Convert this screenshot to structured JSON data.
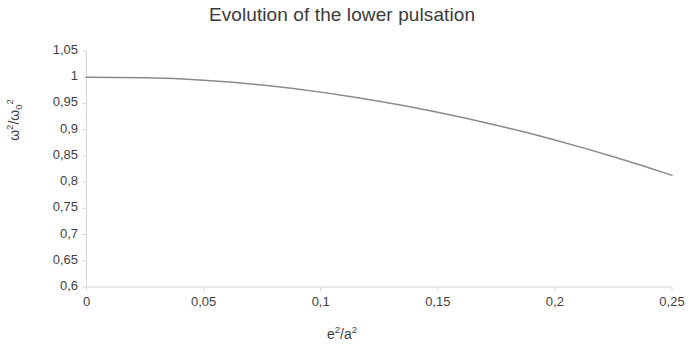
{
  "chart_data": {
    "type": "line",
    "title": "Evolution of the lower pulsation",
    "xlabel": "e²/a²",
    "ylabel": "ω²/ω₀²",
    "xlim": [
      0,
      0.25
    ],
    "ylim": [
      0.6,
      1.05
    ],
    "xtick_labels": [
      "0",
      "0,05",
      "0,1",
      "0,15",
      "0,2",
      "0,25"
    ],
    "xtick_values": [
      0,
      0.05,
      0.1,
      0.15,
      0.2,
      0.25
    ],
    "ytick_labels": [
      "0,6",
      "0,65",
      "0,7",
      "0,75",
      "0,8",
      "0,85",
      "0,9",
      "0,95",
      "1",
      "1,05"
    ],
    "ytick_values": [
      0.6,
      0.65,
      0.7,
      0.75,
      0.8,
      0.85,
      0.9,
      0.95,
      1.0,
      1.05
    ],
    "grid": false,
    "legend": false,
    "line_color": "#8a8a8a",
    "axis_color": "#d4d4d4",
    "series": [
      {
        "name": "lower pulsation",
        "x": [
          0.0,
          0.0125,
          0.025,
          0.0375,
          0.05,
          0.0625,
          0.075,
          0.0875,
          0.1,
          0.1125,
          0.125,
          0.1375,
          0.15,
          0.1625,
          0.175,
          0.1875,
          0.2,
          0.2125,
          0.225,
          0.2375,
          0.25
        ],
        "values": [
          1.0,
          0.9996,
          0.9988,
          0.9974,
          0.9943,
          0.9902,
          0.9853,
          0.9789,
          0.9716,
          0.9634,
          0.9542,
          0.9442,
          0.9332,
          0.9214,
          0.9086,
          0.8949,
          0.8803,
          0.8648,
          0.8484,
          0.8311,
          0.8129
        ]
      }
    ]
  },
  "title_text": "Evolution of the lower pulsation",
  "ylabel_parts": {
    "omega": "ω",
    "sup2a": "2",
    "slash": "/",
    "omega0": "ω",
    "sub0": "0",
    "sup2b": "2"
  },
  "xlabel_parts": {
    "e": "e",
    "sup2a": "2",
    "slash": "/",
    "a": "a",
    "sup2b": "2"
  }
}
